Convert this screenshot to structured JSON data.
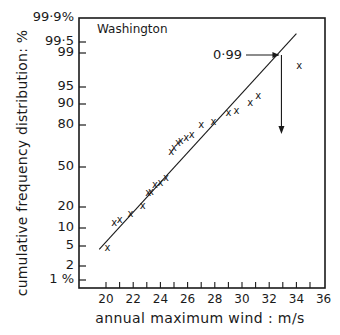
{
  "chart_data": {
    "type": "scatter",
    "title": "Washington",
    "xlabel": "annual maximum wind : m/s",
    "ylabel": "cumulative frequency distribution: %",
    "xlim": [
      18,
      36
    ],
    "x_ticks": [
      20,
      22,
      24,
      26,
      28,
      30,
      32,
      34,
      36
    ],
    "y_scale": "normal-probability",
    "y_ticks": [
      "99·9%",
      "99·5",
      "99",
      "95",
      "90",
      "80",
      "50",
      "20",
      "10",
      "5",
      "2",
      "1 %"
    ],
    "grid": false,
    "legend": null,
    "series": [
      {
        "name": "observed annual maxima",
        "marker": "x",
        "points": [
          {
            "x": 20.1,
            "y": 5
          },
          {
            "x": 20.6,
            "y": 13
          },
          {
            "x": 21.0,
            "y": 14
          },
          {
            "x": 21.8,
            "y": 17
          },
          {
            "x": 22.7,
            "y": 22
          },
          {
            "x": 23.1,
            "y": 30
          },
          {
            "x": 23.3,
            "y": 31
          },
          {
            "x": 23.6,
            "y": 36
          },
          {
            "x": 24.0,
            "y": 38
          },
          {
            "x": 24.4,
            "y": 42
          },
          {
            "x": 24.8,
            "y": 63
          },
          {
            "x": 25.0,
            "y": 66
          },
          {
            "x": 25.3,
            "y": 70
          },
          {
            "x": 25.5,
            "y": 71
          },
          {
            "x": 25.9,
            "y": 73
          },
          {
            "x": 26.3,
            "y": 75
          },
          {
            "x": 27.0,
            "y": 81
          },
          {
            "x": 27.9,
            "y": 83
          },
          {
            "x": 29.0,
            "y": 87
          },
          {
            "x": 29.6,
            "y": 88
          },
          {
            "x": 30.6,
            "y": 91
          },
          {
            "x": 31.2,
            "y": 93
          },
          {
            "x": 34.2,
            "y": 98.2
          }
        ]
      },
      {
        "name": "fitted line",
        "type": "line",
        "points": [
          {
            "x": 19.5,
            "y": 4.5
          },
          {
            "x": 34.0,
            "y": 99.7
          }
        ]
      }
    ],
    "annotations": [
      {
        "text": "0·99",
        "arrow_to": {
          "x": 32.9,
          "y": 99
        },
        "then_down_to_x": 32.9
      }
    ]
  },
  "labels": {
    "station": "Washington",
    "annotation": "0·99",
    "xlabel": "annual maximum wind : m/s",
    "ylabel": "cumulative frequency distribution: %"
  },
  "yticks": [
    {
      "label": "99·9%",
      "py": 18
    },
    {
      "label": "99·5",
      "py": 42
    },
    {
      "label": "99",
      "py": 53
    },
    {
      "label": "95",
      "py": 87
    },
    {
      "label": "90",
      "py": 104
    },
    {
      "label": "80",
      "py": 125
    },
    {
      "label": "50",
      "py": 167
    },
    {
      "label": "20",
      "py": 207
    },
    {
      "label": "10",
      "py": 228
    },
    {
      "label": "5",
      "py": 246
    },
    {
      "label": "2",
      "py": 266
    },
    {
      "label": "1 %",
      "py": 280
    }
  ],
  "xticks": [
    "20",
    "22",
    "24",
    "26",
    "28",
    "30",
    "32",
    "34",
    "36"
  ]
}
